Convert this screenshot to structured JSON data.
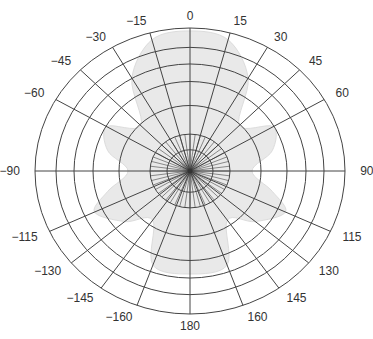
{
  "chart_data": {
    "type": "polar",
    "title": "",
    "angular_unit": "degrees",
    "zero_direction": "top",
    "direction": "clockwise",
    "angle_ticks": [
      0,
      15,
      30,
      45,
      60,
      90,
      115,
      130,
      145,
      160,
      180,
      -160,
      -145,
      -130,
      -115,
      -90,
      -60,
      -45,
      -30,
      -15
    ],
    "angle_tick_labels": [
      "0",
      "15",
      "30",
      "45",
      "60",
      "90",
      "115",
      "130",
      "145",
      "160",
      "180",
      "−160",
      "−145",
      "−130",
      "−115",
      "−90",
      "−60",
      "−45",
      "−30",
      "−15"
    ],
    "radial_rings": 7,
    "radial_tick_labels": [],
    "grid": true,
    "legend": null,
    "series": [
      {
        "name": "radiation pattern",
        "style": "filled light gray area",
        "description": "Faint gray lobed pattern: main lobe toward 0° (up), side lobes near ±60° and ±120°, lobes toward 180°",
        "theta": [
          0,
          15,
          30,
          45,
          60,
          75,
          90,
          105,
          115,
          130,
          145,
          160,
          180,
          -160,
          -145,
          -130,
          -115,
          -105,
          -90,
          -75,
          -60,
          -45,
          -30,
          -15
        ],
        "r_relative": [
          0.98,
          0.95,
          0.75,
          0.45,
          0.62,
          0.55,
          0.4,
          0.55,
          0.68,
          0.55,
          0.42,
          0.7,
          0.72,
          0.7,
          0.42,
          0.55,
          0.68,
          0.55,
          0.4,
          0.55,
          0.62,
          0.45,
          0.75,
          0.95
        ]
      }
    ]
  },
  "colors": {
    "grid": "#444444",
    "fill": "#e9e9e9",
    "fill_stroke": "#dcdcdc",
    "label": "#333333",
    "background": "#ffffff"
  }
}
